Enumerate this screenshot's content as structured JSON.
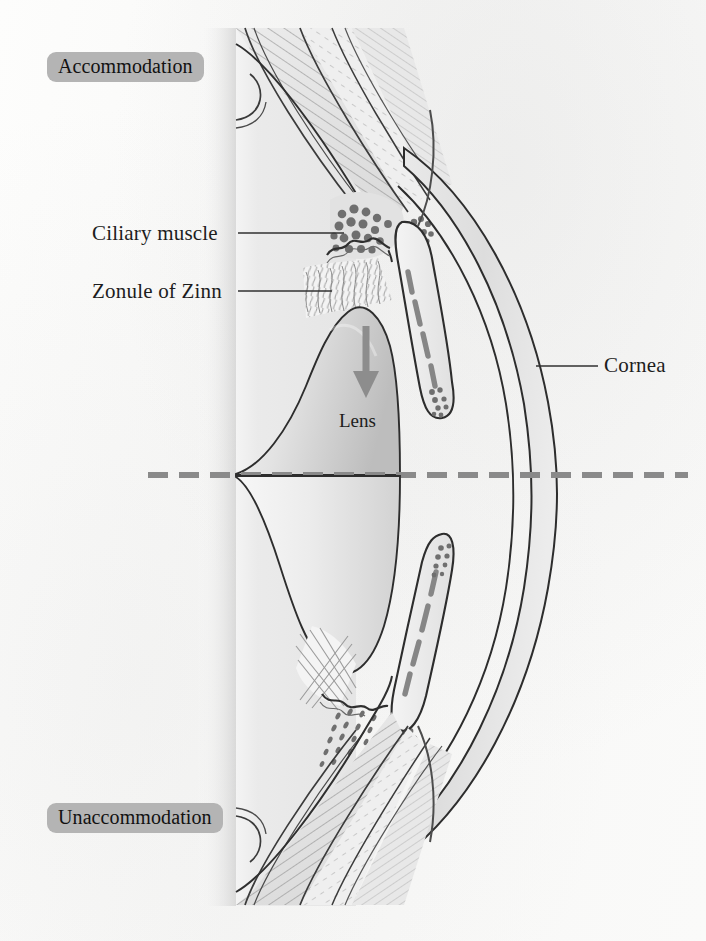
{
  "figure": {
    "background_color": "#fbfbfa",
    "ink_color": "#2b2b2b",
    "badge_color": "#b4b4b4",
    "midline_color": "#8a8a8a",
    "arrow_color": "#8d8d8d"
  },
  "state_badges": [
    {
      "id": "accommodation",
      "label": "Accommodation",
      "position": "top-left"
    },
    {
      "id": "unaccommodation",
      "label": "Unaccommodation",
      "position": "bottom-left"
    }
  ],
  "leader_labels": [
    {
      "id": "ciliary-muscle",
      "label": "Ciliary muscle",
      "side": "left",
      "leader": true
    },
    {
      "id": "zonule-of-zinn",
      "label": "Zonule of Zinn",
      "side": "left",
      "leader": true
    },
    {
      "id": "cornea",
      "label": "Cornea",
      "side": "right",
      "leader": true
    }
  ],
  "inline_labels": [
    {
      "id": "lens",
      "label": "Lens"
    }
  ],
  "annotations": {
    "accommodation_arrow": {
      "name": "lens-thickening-arrow",
      "direction": "down",
      "description": "gray arrow inside upper lens half"
    },
    "optical_axis": {
      "name": "optical-axis-midline",
      "style": "dashed",
      "description": "horizontal dashed line separating accommodated (upper) and unaccommodated (lower) halves"
    }
  },
  "structures": [
    "sclera",
    "choroid",
    "ciliary muscle",
    "ciliary processes",
    "zonule of Zinn",
    "lens",
    "iris",
    "anterior chamber",
    "cornea",
    "limbus"
  ]
}
